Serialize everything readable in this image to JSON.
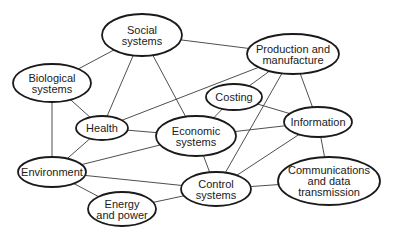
{
  "diagram": {
    "type": "network",
    "colors": {
      "stroke": "#1a1a1a",
      "edge": "#3a3a3a",
      "background": "#ffffff"
    },
    "nodes": [
      {
        "id": "social",
        "lines": [
          "Social",
          "systems"
        ],
        "cx": 142,
        "cy": 35,
        "rx": 40,
        "ry": 21
      },
      {
        "id": "production",
        "lines": [
          "Production and",
          "manufacture"
        ],
        "cx": 293,
        "cy": 54,
        "rx": 46,
        "ry": 20
      },
      {
        "id": "biological",
        "lines": [
          "Biological",
          "systems"
        ],
        "cx": 52,
        "cy": 83,
        "rx": 39,
        "ry": 19
      },
      {
        "id": "costing",
        "lines": [
          "Costing"
        ],
        "cx": 234,
        "cy": 97,
        "rx": 28,
        "ry": 13
      },
      {
        "id": "health",
        "lines": [
          "Health"
        ],
        "cx": 102,
        "cy": 128,
        "rx": 26,
        "ry": 12
      },
      {
        "id": "economic",
        "lines": [
          "Economic",
          "systems"
        ],
        "cx": 196,
        "cy": 136,
        "rx": 40,
        "ry": 20
      },
      {
        "id": "information",
        "lines": [
          "Information"
        ],
        "cx": 318,
        "cy": 122,
        "rx": 34,
        "ry": 15
      },
      {
        "id": "environment",
        "lines": [
          "Environment"
        ],
        "cx": 52,
        "cy": 172,
        "rx": 34,
        "ry": 15
      },
      {
        "id": "control",
        "lines": [
          "Control",
          "systems"
        ],
        "cx": 216,
        "cy": 189,
        "rx": 35,
        "ry": 17
      },
      {
        "id": "communications",
        "lines": [
          "Communications",
          "and data",
          "transmission"
        ],
        "cx": 329,
        "cy": 181,
        "rx": 51,
        "ry": 24
      },
      {
        "id": "energy",
        "lines": [
          "Energy",
          "and power"
        ],
        "cx": 122,
        "cy": 209,
        "rx": 34,
        "ry": 17
      }
    ],
    "edges": [
      [
        "social",
        "biological"
      ],
      [
        "social",
        "health"
      ],
      [
        "social",
        "economic"
      ],
      [
        "social",
        "production"
      ],
      [
        "biological",
        "health"
      ],
      [
        "biological",
        "environment"
      ],
      [
        "health",
        "economic"
      ],
      [
        "health",
        "environment"
      ],
      [
        "health",
        "production"
      ],
      [
        "production",
        "costing"
      ],
      [
        "production",
        "information"
      ],
      [
        "production",
        "control"
      ],
      [
        "costing",
        "economic"
      ],
      [
        "costing",
        "information"
      ],
      [
        "economic",
        "information"
      ],
      [
        "economic",
        "environment"
      ],
      [
        "economic",
        "control"
      ],
      [
        "environment",
        "control"
      ],
      [
        "environment",
        "energy"
      ],
      [
        "energy",
        "control"
      ],
      [
        "information",
        "control"
      ],
      [
        "information",
        "communications"
      ],
      [
        "control",
        "communications"
      ]
    ]
  }
}
